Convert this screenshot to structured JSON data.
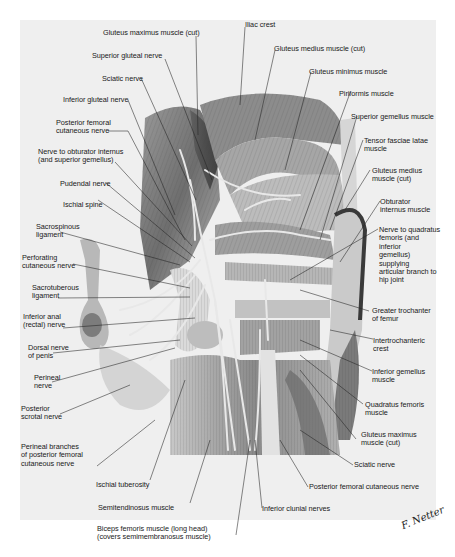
{
  "figure": {
    "style": "grayscale anatomical illustration",
    "signature": "F. Netter",
    "colors": {
      "background": "#efefef",
      "margin": "#ffffff",
      "text": "#1a1a1a",
      "leader": "#222222"
    }
  },
  "labels": {
    "top": [
      {
        "id": "gluteus-maximus-cut-top",
        "text": "Gluteus maximus muscle (cut)"
      },
      {
        "id": "iliac-crest",
        "text": "Iliac crest"
      },
      {
        "id": "superior-gluteal-nerve",
        "text": "Superior gluteal nerve"
      },
      {
        "id": "gluteus-medius-cut-top",
        "text": "Gluteus medius muscle (cut)"
      },
      {
        "id": "sciatic-nerve-top",
        "text": "Sciatic nerve"
      },
      {
        "id": "gluteus-minimus",
        "text": "Gluteus minimus muscle"
      }
    ],
    "left": [
      {
        "id": "inferior-gluteal-nerve",
        "text": "Inferior gluteal nerve"
      },
      {
        "id": "posterior-femoral-cutaneous-nerve-left",
        "text": "Posterior femoral\ncutaneous nerve"
      },
      {
        "id": "nerve-to-obturator-internus",
        "text": "Nerve to obturator internus\n(and superior gemellus)"
      },
      {
        "id": "pudendal-nerve",
        "text": "Pudendal nerve"
      },
      {
        "id": "ischial-spine",
        "text": "Ischial spine"
      },
      {
        "id": "sacrospinous-ligament",
        "text": "Sacrospinous\nligament"
      },
      {
        "id": "perforating-cutaneous-nerve",
        "text": "Perforating\ncutaneous nerve"
      },
      {
        "id": "sacrotuberous-ligament",
        "text": "Sacrotuberous\nligament"
      },
      {
        "id": "inferior-anal-nerve",
        "text": "Inferior anal\n(rectal) nerve"
      },
      {
        "id": "dorsal-nerve-of-penis",
        "text": "Dorsal nerve\nof penis"
      },
      {
        "id": "perineal-nerve",
        "text": "Perineal\nnerve"
      },
      {
        "id": "posterior-scrotal-nerve",
        "text": "Posterior\nscrotal nerve"
      },
      {
        "id": "perineal-branches",
        "text": "Perineal branches\nof posterior femoral\ncutaneous nerve"
      }
    ],
    "right": [
      {
        "id": "piriformis",
        "text": "Piriformis muscle"
      },
      {
        "id": "superior-gemellus",
        "text": "Superior gemellus muscle"
      },
      {
        "id": "tensor-fasciae-latae",
        "text": "Tensor fasciae latae\nmuscle"
      },
      {
        "id": "gluteus-medius-cut-right",
        "text": "Gluteus medius\nmuscle (cut)"
      },
      {
        "id": "obturator-internus",
        "text": "Obturator\ninternus muscle"
      },
      {
        "id": "nerve-to-quadratus-femoris",
        "text": "Nerve to quadratus\nfemoris (and\ninferior\ngemellus)\nsupplying\narticular branch to\nhip joint"
      },
      {
        "id": "greater-trochanter",
        "text": "Greater trochanter\nof femur"
      },
      {
        "id": "intertrochanteric-crest",
        "text": "Intertrochanteric\ncrest"
      },
      {
        "id": "inferior-gemellus",
        "text": "Inferior gemellus\nmuscle"
      },
      {
        "id": "quadratus-femoris",
        "text": "Quadratus femoris\nmuscle"
      },
      {
        "id": "gluteus-maximus-cut-right",
        "text": "Gluteus maximus\nmuscle (cut)"
      },
      {
        "id": "sciatic-nerve-bottom",
        "text": "Sciatic nerve"
      }
    ],
    "bottom": [
      {
        "id": "posterior-femoral-cutaneous-nerve-bottom",
        "text": "Posterior femoral cutaneous nerve"
      },
      {
        "id": "ischial-tuberosity",
        "text": "Ischial tuberosity"
      },
      {
        "id": "semitendinosus",
        "text": "Semitendinosus muscle"
      },
      {
        "id": "inferior-clunial-nerves",
        "text": "Inferior clunial nerves"
      },
      {
        "id": "biceps-femoris",
        "text": "Biceps femoris muscle (long head)\n(covers semimembranosus muscle)"
      }
    ]
  }
}
